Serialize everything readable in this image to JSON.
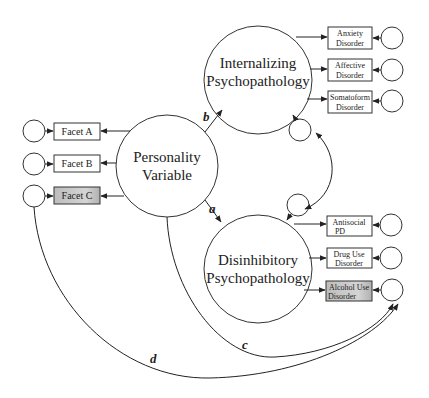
{
  "latent": {
    "personality": {
      "line1": "Personality",
      "line2": "Variable"
    },
    "internalizing": {
      "line1": "Internalizing",
      "line2": "Psychopathology"
    },
    "disinhibitory": {
      "line1": "Disinhibitory",
      "line2": "Psychopathology"
    }
  },
  "facets": [
    {
      "label": "Facet A",
      "shaded": false
    },
    {
      "label": "Facet B",
      "shaded": false
    },
    {
      "label": "Facet C",
      "shaded": true
    }
  ],
  "internalizing_indicators": [
    {
      "line1": "Anxiety",
      "line2": "Disorder",
      "shaded": false
    },
    {
      "line1": "Affective",
      "line2": "Disorder",
      "shaded": false
    },
    {
      "line1": "Somatoform",
      "line2": "Disorder",
      "shaded": false
    }
  ],
  "disinhibitory_indicators": [
    {
      "line1": "Antisocial",
      "line2": "PD",
      "shaded": false
    },
    {
      "line1": "Drug Use",
      "line2": "Disorder",
      "shaded": false
    },
    {
      "line1": "Alcohol Use",
      "line2": "Disorder",
      "shaded": true
    }
  ],
  "paths": {
    "a": "a",
    "b": "b",
    "c": "c",
    "d": "d"
  },
  "colors": {
    "stroke": "#222222",
    "shade": "#c8c8c8",
    "background": "#ffffff"
  }
}
